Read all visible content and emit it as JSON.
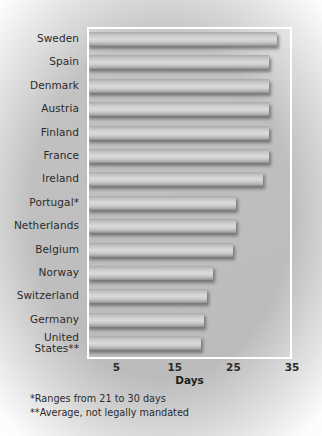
{
  "chart_data": {
    "type": "bar",
    "orientation": "horizontal",
    "title": "",
    "xlabel": "Days",
    "ylabel": "",
    "xlim": [
      0,
      35
    ],
    "xticks": [
      5,
      15,
      25,
      35
    ],
    "grid": false,
    "legend": null,
    "categories": [
      "Sweden",
      "Spain",
      "Denmark",
      "Austria",
      "Finland",
      "France",
      "Ireland",
      "Portugal*",
      "Netherlands",
      "Belgium",
      "Norway",
      "Switzerland",
      "Germany",
      "United\nStates**"
    ],
    "values": [
      32.5,
      31,
      31,
      31,
      31,
      31,
      30,
      25.5,
      25.5,
      25,
      21.5,
      20.5,
      20,
      19.5
    ]
  },
  "axis": {
    "x_title": "Days",
    "tick_labels": [
      "5",
      "15",
      "25",
      "35"
    ]
  },
  "footnotes": [
    "*Ranges from 21 to 30 days",
    "**Average, not legally mandated"
  ],
  "colors": {
    "background": "#c4c4c4",
    "bar_light": "#dadada",
    "bar_dark": "#8e8e8e",
    "frame": "#ffffff",
    "text": "#2b2b2b"
  }
}
